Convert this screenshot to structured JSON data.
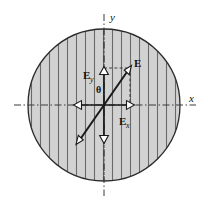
{
  "figure": {
    "background_color": "#ffffff",
    "line_color": "#2b2b2b",
    "hatch_color": "#6e6e6e",
    "fill_color": "#d2d2d2",
    "arrow_fill": "#ffffff"
  },
  "axes": {
    "x_label": "x",
    "y_label": "y",
    "style": "dash-dot",
    "origin": {
      "x": 104,
      "y": 105
    }
  },
  "region": {
    "shape": "circle",
    "center_x": 104,
    "center_y": 105,
    "radius": 76,
    "hatching": "vertical-lines",
    "hatch_spacing": 9
  },
  "vectors": [
    {
      "name": "E",
      "label": "E",
      "subscript": "",
      "description": "resultant electric field vector",
      "from": {
        "x": 104,
        "y": 105
      },
      "to": {
        "x": 130,
        "y": 68
      },
      "label_pos": {
        "x": 135,
        "y": 64
      },
      "arrowhead": "hollow"
    },
    {
      "name": "E-reverse",
      "label": "",
      "subscript": "",
      "description": "opposite-direction tail of the E vector",
      "from": {
        "x": 104,
        "y": 105
      },
      "to": {
        "x": 78,
        "y": 142
      },
      "label_pos": {
        "x": 0,
        "y": 0
      },
      "arrowhead": "hollow"
    },
    {
      "name": "Ey",
      "label": "E",
      "subscript": "y",
      "description": "y-component of the electric field",
      "from": {
        "x": 104,
        "y": 105
      },
      "to": {
        "x": 104,
        "y": 68
      },
      "label_pos": {
        "x": 87,
        "y": 76
      },
      "arrowhead": "hollow"
    },
    {
      "name": "Ey-reverse",
      "label": "",
      "subscript": "",
      "description": "downward y-axis arrow",
      "from": {
        "x": 104,
        "y": 105
      },
      "to": {
        "x": 104,
        "y": 142
      },
      "label_pos": {
        "x": 0,
        "y": 0
      },
      "arrowhead": "hollow"
    },
    {
      "name": "Ex",
      "label": "E",
      "subscript": "x",
      "description": "x-component of the electric field",
      "from": {
        "x": 104,
        "y": 105
      },
      "to": {
        "x": 130,
        "y": 105
      },
      "label_pos": {
        "x": 120,
        "y": 122
      },
      "arrowhead": "hollow"
    },
    {
      "name": "Ex-reverse",
      "label": "",
      "subscript": "",
      "description": "leftward x-axis arrow",
      "from": {
        "x": 104,
        "y": 105
      },
      "to": {
        "x": 78,
        "y": 105
      },
      "label_pos": {
        "x": 0,
        "y": 0
      },
      "arrowhead": "hollow"
    }
  ],
  "angle": {
    "symbol": "θ",
    "label_pos": {
      "x": 99,
      "y": 90
    },
    "description": "angle between E and the x-axis"
  },
  "projection_lines": [
    {
      "name": "horizontal-projection",
      "description": "dashed line from Ey tip to E tip",
      "from": {
        "x": 104,
        "y": 68
      },
      "to": {
        "x": 130,
        "y": 68
      }
    },
    {
      "name": "vertical-projection",
      "description": "dashed line from E tip down to Ex tip",
      "from": {
        "x": 130,
        "y": 68
      },
      "to": {
        "x": 130,
        "y": 105
      }
    }
  ]
}
